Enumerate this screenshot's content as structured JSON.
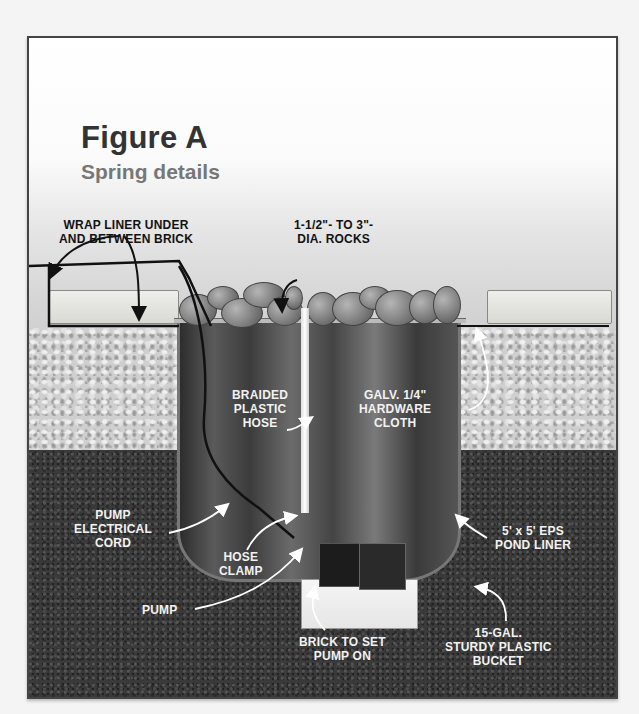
{
  "figure": {
    "title": "Figure A",
    "subtitle": "Spring details"
  },
  "labels": {
    "wrap_liner": "WRAP LINER UNDER\nAND BETWEEN BRICK",
    "rocks": "1-1/2\"- TO 3\"-\nDIA. ROCKS",
    "braided_hose": "BRAIDED\nPLASTIC\nHOSE",
    "hardware_cloth": "GALV. 1/4\"\nHARDWARE\nCLOTH",
    "electrical_cord": "PUMP\nELECTRICAL\nCORD",
    "hose_clamp": "HOSE\nCLAMP",
    "pond_liner": "5' x 5' EPS\nPOND LINER",
    "pump": "PUMP",
    "brick": "BRICK TO SET\nPUMP ON",
    "bucket": "15-GAL.\nSTURDY PLASTIC\nBUCKET"
  },
  "colors": {
    "title": "#333333",
    "subtitle": "#777777",
    "soil": "#3a3a3a",
    "gravel": "#cfcfcf",
    "frame_border": "#444444"
  }
}
